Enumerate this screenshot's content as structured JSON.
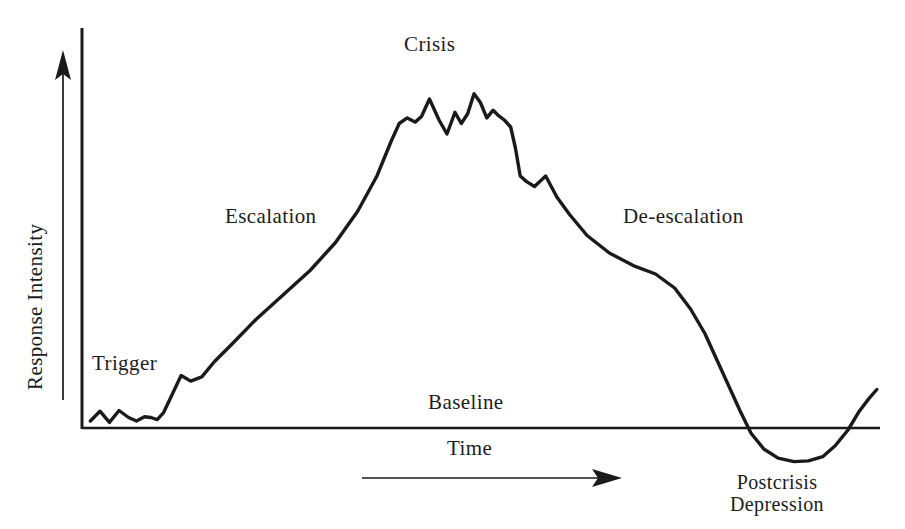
{
  "figure": {
    "background_color": "#ffffff",
    "line_color": "#1a1a1a",
    "text_color": "#1c1c1c"
  },
  "axes": {
    "y_axis_label": "Response Intensity",
    "x_axis_label": "Time",
    "baseline_label": "Baseline",
    "y_axis_arrow": "arrow-up",
    "x_axis_arrow": "arrow-right"
  },
  "phase_labels": {
    "trigger": "Trigger",
    "escalation": "Escalation",
    "crisis": "Crisis",
    "de_escalation": "De-escalation",
    "postcrisis_line1": "Postcrisis",
    "postcrisis_line2": "Depression"
  },
  "chart_data": {
    "type": "line",
    "xlabel": "Time",
    "ylabel": "Response Intensity",
    "xlim": [
      0,
      100
    ],
    "ylim": [
      -12,
      100
    ],
    "grid": false,
    "legend": "none",
    "baseline_value": 0,
    "annotations": [
      {
        "text": "Trigger",
        "x": 5,
        "y": 12
      },
      {
        "text": "Escalation",
        "x": 22,
        "y": 55
      },
      {
        "text": "Crisis",
        "x": 45,
        "y": 98
      },
      {
        "text": "De-escalation",
        "x": 73,
        "y": 55
      },
      {
        "text": "Baseline",
        "x": 47,
        "y": 7
      },
      {
        "text": "Postcrisis Depression",
        "x": 85,
        "y": -18
      }
    ],
    "series": [
      {
        "name": "Response intensity over time",
        "x": [
          0.8,
          2.0,
          3.2,
          4.4,
          5.6,
          6.6,
          7.6,
          8.4,
          9.2,
          10.0,
          11.0,
          12.2,
          13.4,
          14.8,
          16.4,
          18.6,
          21.6,
          25.0,
          28.4,
          31.6,
          34.4,
          36.8,
          38.6,
          39.6,
          40.6,
          41.6,
          42.4,
          43.4,
          44.6,
          45.6,
          46.6,
          47.4,
          48.2,
          49.0,
          49.8,
          50.6,
          51.4,
          52.0,
          52.8,
          53.6,
          54.2,
          54.8,
          55.6,
          56.6,
          58.0,
          59.4,
          61.0,
          63.2,
          66.0,
          69.0,
          71.8,
          74.2,
          76.2,
          78.0,
          79.6,
          81.0,
          82.4,
          83.8,
          85.4,
          87.2,
          89.2,
          91.0,
          92.8,
          94.4,
          96.0,
          97.4,
          98.6,
          99.6
        ],
        "y": [
          2.0,
          4.8,
          1.6,
          5.0,
          3.0,
          2.0,
          3.2,
          3.0,
          2.4,
          4.4,
          9.2,
          15.0,
          13.4,
          14.6,
          19.0,
          24.0,
          31.0,
          38.0,
          45.0,
          53.0,
          62.0,
          72.0,
          82.0,
          87.0,
          88.6,
          87.4,
          89.0,
          94.0,
          88.0,
          84.0,
          90.2,
          87.0,
          89.8,
          95.5,
          93.0,
          88.6,
          90.8,
          89.4,
          88.0,
          86.0,
          80.0,
          72.0,
          70.4,
          69.0,
          72.0,
          66.0,
          61.0,
          55.0,
          50.0,
          46.4,
          44.0,
          40.0,
          34.0,
          27.0,
          19.0,
          12.0,
          5.0,
          -1.5,
          -6.0,
          -8.6,
          -9.6,
          -9.4,
          -8.2,
          -5.0,
          -0.5,
          4.8,
          8.4,
          11.0
        ]
      }
    ]
  }
}
